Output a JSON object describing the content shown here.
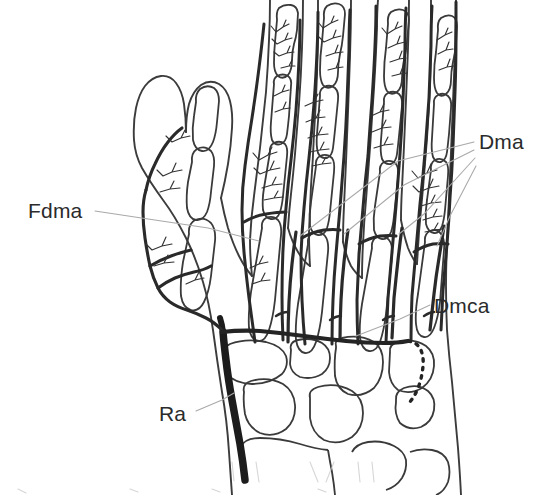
{
  "figure": {
    "kind": "anatomical-line-drawing",
    "background_color": "#ffffff",
    "ink_color": "#2b2b2b",
    "bone_outline_color": "#3a3a3a",
    "artery_color": "#262626",
    "major_artery_color": "#1a1a1a",
    "leader_line_color": "#a9a9a9",
    "label_text_color": "#2b2b2b",
    "width": 544,
    "height": 495
  },
  "annotations": [
    {
      "id": "fdma",
      "label": "Fdma",
      "meaning": "first dorsal metacarpal artery",
      "side": "left",
      "leaders": 1
    },
    {
      "id": "dma",
      "label": "Dma",
      "meaning": "dorsal metacarpal arteries",
      "side": "right",
      "leaders": 4
    },
    {
      "id": "dmca",
      "label": "Dmca",
      "meaning": "dorsal metacarpal / carpal arch",
      "side": "right",
      "leaders": 1
    },
    {
      "id": "ra",
      "label": "Ra",
      "meaning": "radial artery",
      "side": "left",
      "leaders": 1
    }
  ],
  "labels": {
    "fdma": "Fdma",
    "dma": "Dma",
    "dmca": "Dmca",
    "ra": "Ra"
  }
}
